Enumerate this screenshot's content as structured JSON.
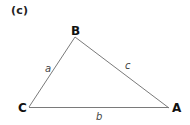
{
  "panel": {
    "label": "(c)"
  },
  "triangle": {
    "vertices": {
      "B": {
        "label": "B",
        "x": 75,
        "y": 37
      },
      "C": {
        "label": "C",
        "x": 29,
        "y": 107
      },
      "A": {
        "label": "A",
        "x": 169,
        "y": 108
      }
    },
    "sides": {
      "a": {
        "label": "a",
        "between": [
          "B",
          "C"
        ]
      },
      "b": {
        "label": "b",
        "between": [
          "C",
          "A"
        ]
      },
      "c": {
        "label": "c",
        "between": [
          "B",
          "A"
        ]
      }
    },
    "colors": {
      "edge": "#7a7a7a",
      "vertex_text": "#111111",
      "side_text": "#444444"
    }
  }
}
